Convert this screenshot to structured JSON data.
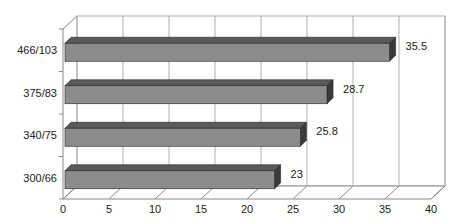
{
  "chart_data": {
    "type": "bar",
    "orientation": "horizontal",
    "style": "3d",
    "title": "",
    "xlabel": "",
    "ylabel": "",
    "categories": [
      "300/66",
      "340/75",
      "375/83",
      "466/103"
    ],
    "values": [
      23,
      25.8,
      28.7,
      35.5
    ],
    "data_labels": [
      "23",
      "25.8",
      "28.7",
      "35.5"
    ],
    "xlim": [
      0,
      40
    ],
    "x_ticks": [
      "0",
      "5",
      "10",
      "15",
      "20",
      "25",
      "30",
      "35",
      "40"
    ],
    "grid": true,
    "legend": null,
    "colors": {
      "bar_face": "#8c8c8c",
      "bar_top": "#5a5a5a",
      "bar_side": "#3a3a3a",
      "grid": "#b0b0b0",
      "axis": "#888888"
    }
  }
}
